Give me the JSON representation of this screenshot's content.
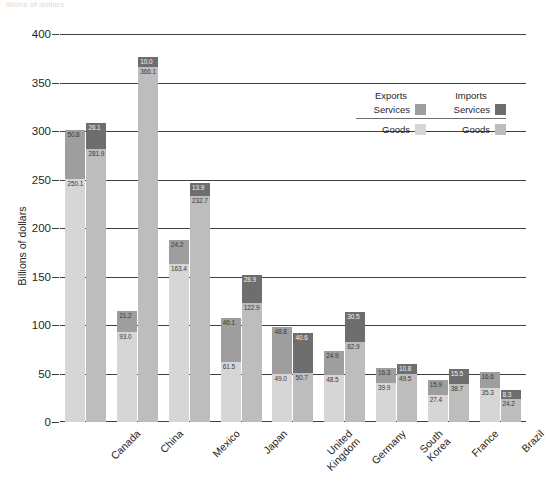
{
  "top_title": "illions of dollars",
  "legend": {
    "exports_title": "Exports",
    "imports_title": "Imports",
    "services_label_exports": "Services",
    "services_label_imports": "Services",
    "goods_label_exports": "Goods",
    "goods_label_imports": "Goods",
    "colors": {
      "exports_services": "#9e9e9e",
      "exports_goods": "#d6d6d6",
      "imports_services": "#6e6e6e",
      "imports_goods": "#bdbdbd"
    }
  },
  "chart_data": {
    "type": "bar",
    "title": "",
    "xlabel": "",
    "ylabel": "Billions of dollars",
    "ylim": [
      0,
      400
    ],
    "yticks": [
      0,
      50,
      100,
      150,
      200,
      250,
      300,
      350,
      400
    ],
    "grid": true,
    "legend_position": "upper right",
    "stacked": true,
    "categories": [
      "Canada",
      "China",
      "Mexico",
      "Japan",
      "United\nKingdom",
      "Germany",
      "South\nKorea",
      "France",
      "Brazil"
    ],
    "series": [
      {
        "name": "Exports Goods",
        "values": [
          250.1,
          93.0,
          163.4,
          61.5,
          49.0,
          48.5,
          39.9,
          27.4,
          35.3
        ]
      },
      {
        "name": "Exports Services",
        "values": [
          50.8,
          21.2,
          24.2,
          46.1,
          48.8,
          24.9,
          16.3,
          15.9,
          16.6
        ]
      },
      {
        "name": "Imports Goods",
        "values": [
          281.9,
          366.1,
          232.7,
          122.9,
          50.7,
          82.9,
          49.5,
          38.7,
          24.2
        ]
      },
      {
        "name": "Imports Services",
        "values": [
          26.1,
          10.0,
          13.9,
          28.9,
          40.6,
          30.5,
          10.8,
          15.5,
          8.3
        ]
      }
    ]
  }
}
